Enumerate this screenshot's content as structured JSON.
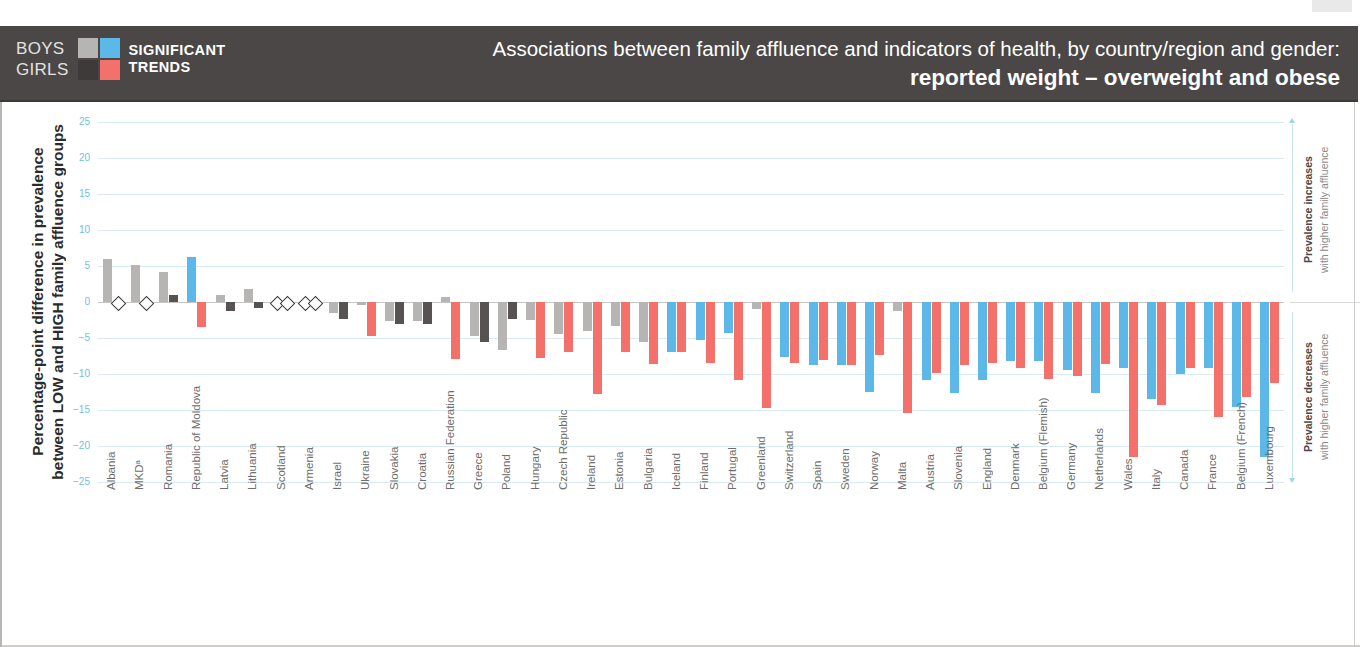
{
  "header": {
    "legend": {
      "boys_label": "BOYS",
      "girls_label": "GIRLS",
      "trends_line1": "SIGNIFICANT",
      "trends_line2": "TRENDS",
      "swatch_colors": {
        "boys_nonsig": "#b7b5b3",
        "boys_sig": "#5bb8e8",
        "girls_nonsig": "#4a4746",
        "girls_sig": "#f4706a"
      }
    },
    "title_line1": "Associations between family affluence and indicators of health, by country/region and gender:",
    "title_line2": "reported weight – overweight and obese",
    "band_color": "#4a4746"
  },
  "axis": {
    "y_title": "Percentage-point difference in prevalence\nbetween LOW and HIGH family affluence groups",
    "y_title_line1": "Percentage-point difference in prevalence",
    "y_title_line2": "between LOW and HIGH family affluence groups",
    "y_ticks": [
      25,
      20,
      15,
      10,
      5,
      0,
      -5,
      -10,
      -15,
      -20,
      -25
    ],
    "y_tick_labels": [
      "25",
      "20",
      "15",
      "10",
      "5",
      "0",
      "−5",
      "−10",
      "−15",
      "−20",
      "−25"
    ],
    "tick_color": "#72c0dd",
    "grid_color": "#d9ecf4"
  },
  "annotations": {
    "increase_bold": "Prevalence increases",
    "increase_rest": "with higher family affluence",
    "decrease_bold": "Prevalence decreases",
    "decrease_rest": "with higher family affluence"
  },
  "chart_data": {
    "type": "bar",
    "title": "Associations between family affluence and indicators of health, by country/region and gender: reported weight – overweight and obese",
    "xlabel": "",
    "ylabel": "Percentage-point difference in prevalence between LOW and HIGH family affluence groups",
    "ylim": [
      -25,
      25
    ],
    "ytick_step": 5,
    "grid": true,
    "legend_position": "header-left",
    "series_colors": {
      "boys_significant": "#5bb8e8",
      "boys_not_significant": "#b7b5b3",
      "girls_significant": "#f4706a",
      "girls_not_significant": "#565352"
    },
    "categories": [
      "Albania",
      "MKDᵃ",
      "Romania",
      "Republic of Moldova",
      "Latvia",
      "Lithuania",
      "Scotland",
      "Armenia",
      "Israel",
      "Ukraine",
      "Slovakia",
      "Croatia",
      "Russian Federation",
      "Greece",
      "Poland",
      "Hungary",
      "Czech Republic",
      "Ireland",
      "Estonia",
      "Bulgaria",
      "Iceland",
      "Finland",
      "Portugal",
      "Greenland",
      "Switzerland",
      "Spain",
      "Sweden",
      "Norway",
      "Malta",
      "Austria",
      "Slovenia",
      "England",
      "Denmark",
      "Belgium (Flemish)",
      "Germany",
      "Netherlands",
      "Wales",
      "Italy",
      "Canada",
      "France",
      "Belgium (French)",
      "Luxembourg"
    ],
    "series": [
      {
        "name": "Boys",
        "values": [
          6.0,
          5.1,
          4.1,
          6.3,
          1.0,
          1.8,
          0.0,
          0.0,
          -1.5,
          -0.4,
          -2.6,
          -2.6,
          0.7,
          -4.7,
          -6.7,
          -2.5,
          -4.5,
          -4.0,
          -3.3,
          -5.6,
          -7.0,
          -5.3,
          -4.3,
          -1.0,
          -7.7,
          -8.7,
          -8.7,
          -12.5,
          -1.2,
          -10.8,
          -12.6,
          -10.8,
          -8.2,
          -8.2,
          -9.5,
          -12.7,
          -9.2,
          -13.5,
          -10.0,
          -9.2,
          -14.6,
          -21.5
        ],
        "significance": [
          "ns",
          "ns",
          "ns",
          "sig",
          "ns",
          "ns",
          "ns",
          "ns",
          "ns",
          "ns",
          "ns",
          "ns",
          "ns",
          "ns",
          "ns",
          "ns",
          "ns",
          "ns",
          "ns",
          "ns",
          "sig",
          "sig",
          "sig",
          "ns",
          "sig",
          "sig",
          "sig",
          "sig",
          "ns",
          "sig",
          "sig",
          "sig",
          "sig",
          "sig",
          "sig",
          "sig",
          "sig",
          "sig",
          "sig",
          "sig",
          "sig",
          "sig"
        ]
      },
      {
        "name": "Girls",
        "values": [
          0.0,
          0.0,
          1.0,
          -3.5,
          -1.3,
          -0.9,
          -2.5,
          -2.1,
          -2.3,
          -4.7,
          -3.0,
          -3.1,
          -7.9,
          -5.6,
          -2.4,
          -7.8,
          -6.9,
          -12.8,
          -7.0,
          -8.6,
          -7.0,
          -8.5,
          -10.8,
          -14.7,
          -8.5,
          -8.0,
          -8.8,
          -7.3,
          -15.4,
          -9.8,
          -8.7,
          -8.5,
          -9.1,
          -10.7,
          -10.3,
          -8.6,
          -21.5,
          -14.3,
          -9.1,
          -16.0,
          -13.2,
          -11.2
        ],
        "significance": [
          "zero",
          "zero",
          "ns",
          "sig",
          "ns",
          "ns",
          "zero",
          "zero",
          "ns",
          "sig",
          "ns",
          "ns",
          "sig",
          "ns",
          "ns",
          "sig",
          "sig",
          "sig",
          "sig",
          "sig",
          "sig",
          "sig",
          "sig",
          "sig",
          "sig",
          "sig",
          "sig",
          "sig",
          "sig",
          "sig",
          "sig",
          "sig",
          "sig",
          "sig",
          "sig",
          "sig",
          "sig",
          "sig",
          "sig",
          "sig",
          "sig",
          "sig"
        ]
      }
    ]
  }
}
